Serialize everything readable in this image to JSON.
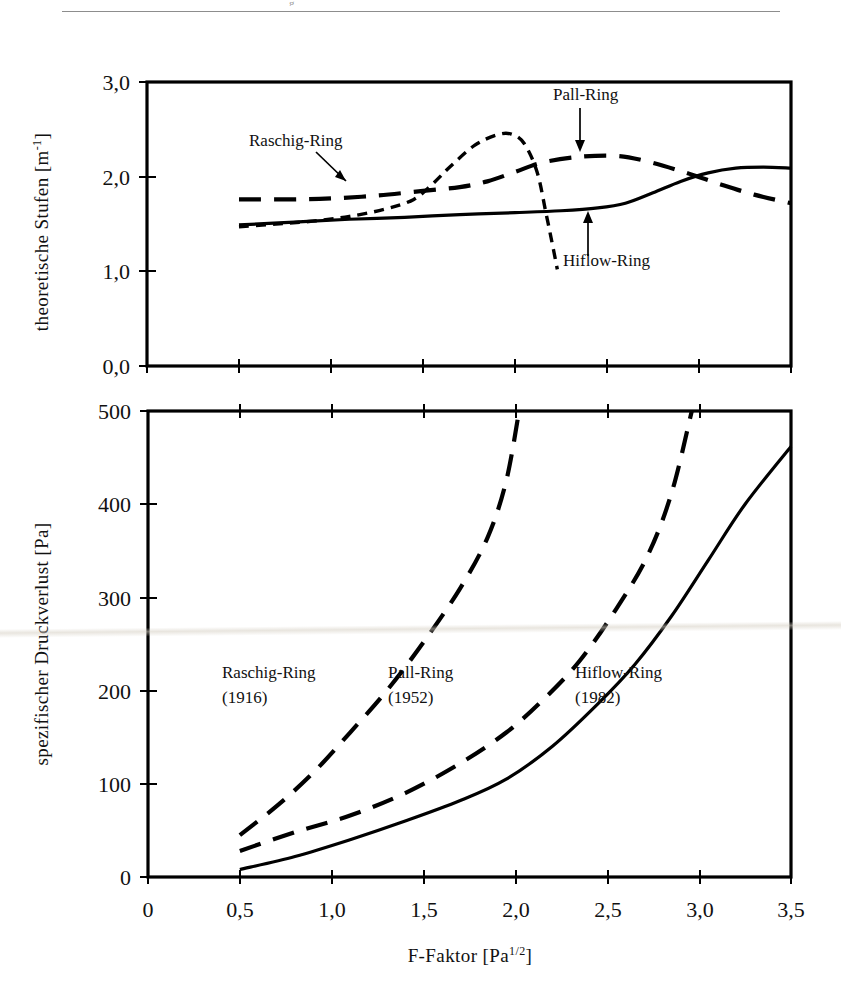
{
  "page": {
    "rule_glyph": "g"
  },
  "figure": {
    "xlabel_main": "F-Faktor [Pa",
    "xlabel_sup": "1/2",
    "xlabel_tail": "]",
    "x_ticks": [
      "0",
      "0,5",
      "1,0",
      "1,5",
      "2,0",
      "2,5",
      "3,0",
      "3,5"
    ],
    "x_values": [
      0,
      0.5,
      1.0,
      1.5,
      2.0,
      2.5,
      3.0,
      3.5
    ]
  },
  "chart_data": [
    {
      "type": "line",
      "id": "upper-panel",
      "title": "",
      "xlabel": "F-Faktor [Pa 1/2]",
      "ylabel": "theoretische Stufen [m-1]",
      "ylabel_main": "theoretische Stufen [m",
      "ylabel_sup": "-1",
      "ylabel_tail": "]",
      "xlim": [
        0,
        3.5
      ],
      "ylim": [
        0,
        3.0
      ],
      "y_ticks": [
        "0,0",
        "1,0",
        "2,0",
        "3,0"
      ],
      "y_values": [
        0,
        1.0,
        2.0,
        3.0
      ],
      "grid": false,
      "legend": "annotated-callouts",
      "annotations": [
        {
          "text": "Raschig-Ring",
          "tx": 249,
          "ty": 146,
          "ax0": 316,
          "ay0": 152,
          "ax1": 348,
          "ay1": 183
        },
        {
          "text": "Pall-Ring",
          "tx": 553,
          "ty": 100,
          "ax0": 580,
          "ay0": 108,
          "ax1": 580,
          "ay1": 151
        },
        {
          "text": "Hiflow-Ring",
          "tx": 563,
          "ty": 264,
          "ax0": 588,
          "ay0": 256,
          "ax1": 588,
          "ay1": 213
        }
      ],
      "series": [
        {
          "name": "Raschig-Ring",
          "style": "short-dash",
          "points": [
            [
              0.5,
              1.47
            ],
            [
              0.7,
              1.5
            ],
            [
              0.9,
              1.53
            ],
            [
              1.1,
              1.58
            ],
            [
              1.3,
              1.66
            ],
            [
              1.45,
              1.76
            ],
            [
              1.55,
              1.92
            ],
            [
              1.65,
              2.11
            ],
            [
              1.78,
              2.33
            ],
            [
              1.9,
              2.44
            ],
            [
              1.98,
              2.45
            ],
            [
              2.05,
              2.35
            ],
            [
              2.12,
              2.05
            ],
            [
              2.17,
              1.6
            ],
            [
              2.21,
              1.22
            ],
            [
              2.23,
              1.02
            ]
          ]
        },
        {
          "name": "Pall-Ring",
          "style": "long-dash",
          "points": [
            [
              0.5,
              1.76
            ],
            [
              0.8,
              1.76
            ],
            [
              1.0,
              1.77
            ],
            [
              1.25,
              1.8
            ],
            [
              1.5,
              1.85
            ],
            [
              1.7,
              1.89
            ],
            [
              1.85,
              1.95
            ],
            [
              2.0,
              2.05
            ],
            [
              2.15,
              2.15
            ],
            [
              2.35,
              2.21
            ],
            [
              2.55,
              2.22
            ],
            [
              2.7,
              2.17
            ],
            [
              2.9,
              2.06
            ],
            [
              3.1,
              1.93
            ],
            [
              3.3,
              1.81
            ],
            [
              3.5,
              1.72
            ]
          ]
        },
        {
          "name": "Hiflow-Ring",
          "style": "solid",
          "points": [
            [
              0.5,
              1.49
            ],
            [
              0.8,
              1.52
            ],
            [
              1.1,
              1.55
            ],
            [
              1.4,
              1.57
            ],
            [
              1.7,
              1.6
            ],
            [
              2.0,
              1.62
            ],
            [
              2.25,
              1.64
            ],
            [
              2.45,
              1.67
            ],
            [
              2.6,
              1.72
            ],
            [
              2.75,
              1.83
            ],
            [
              2.9,
              1.95
            ],
            [
              3.05,
              2.04
            ],
            [
              3.2,
              2.09
            ],
            [
              3.35,
              2.1
            ],
            [
              3.5,
              2.09
            ]
          ]
        }
      ]
    },
    {
      "type": "line",
      "id": "lower-panel",
      "title": "",
      "xlabel": "F-Faktor [Pa 1/2]",
      "ylabel": "spezifischer Druckverlust [Pa]",
      "xlim": [
        0,
        3.5
      ],
      "ylim": [
        0,
        500
      ],
      "y_ticks": [
        "0",
        "100",
        "200",
        "300",
        "400",
        "500"
      ],
      "y_values": [
        0,
        100,
        200,
        300,
        400,
        500
      ],
      "grid": false,
      "legend": "inline-labels",
      "inline_labels": [
        {
          "name": "Raschig-Ring",
          "year": "(1916)",
          "tx": 222,
          "ty": 672
        },
        {
          "name": "Pall-Ring",
          "year": "(1952)",
          "tx": 388,
          "ty": 672
        },
        {
          "name": "Hiflow-Ring",
          "year": "(1982)",
          "tx": 575,
          "ty": 672
        }
      ],
      "series": [
        {
          "name": "Raschig-Ring",
          "year": "(1916)",
          "style": "long-dash",
          "points": [
            [
              0.5,
              45
            ],
            [
              0.7,
              76
            ],
            [
              0.9,
              112
            ],
            [
              1.1,
              155
            ],
            [
              1.3,
              200
            ],
            [
              1.5,
              252
            ],
            [
              1.7,
              310
            ],
            [
              1.85,
              365
            ],
            [
              1.95,
              425
            ],
            [
              2.02,
              500
            ]
          ]
        },
        {
          "name": "Pall-Ring",
          "year": "(1952)",
          "style": "long-dash",
          "points": [
            [
              0.5,
              28
            ],
            [
              0.8,
              48
            ],
            [
              1.1,
              66
            ],
            [
              1.4,
              90
            ],
            [
              1.7,
              122
            ],
            [
              1.95,
              155
            ],
            [
              2.15,
              190
            ],
            [
              2.35,
              232
            ],
            [
              2.55,
              288
            ],
            [
              2.72,
              345
            ],
            [
              2.85,
              412
            ],
            [
              2.96,
              500
            ]
          ]
        },
        {
          "name": "Hiflow-Ring",
          "year": "(1982)",
          "style": "solid",
          "points": [
            [
              0.5,
              8
            ],
            [
              0.8,
              22
            ],
            [
              1.1,
              40
            ],
            [
              1.4,
              60
            ],
            [
              1.7,
              82
            ],
            [
              1.95,
              105
            ],
            [
              2.2,
              140
            ],
            [
              2.45,
              186
            ],
            [
              2.65,
              228
            ],
            [
              2.85,
              280
            ],
            [
              3.05,
              340
            ],
            [
              3.25,
              400
            ],
            [
              3.5,
              462
            ]
          ]
        }
      ]
    }
  ]
}
